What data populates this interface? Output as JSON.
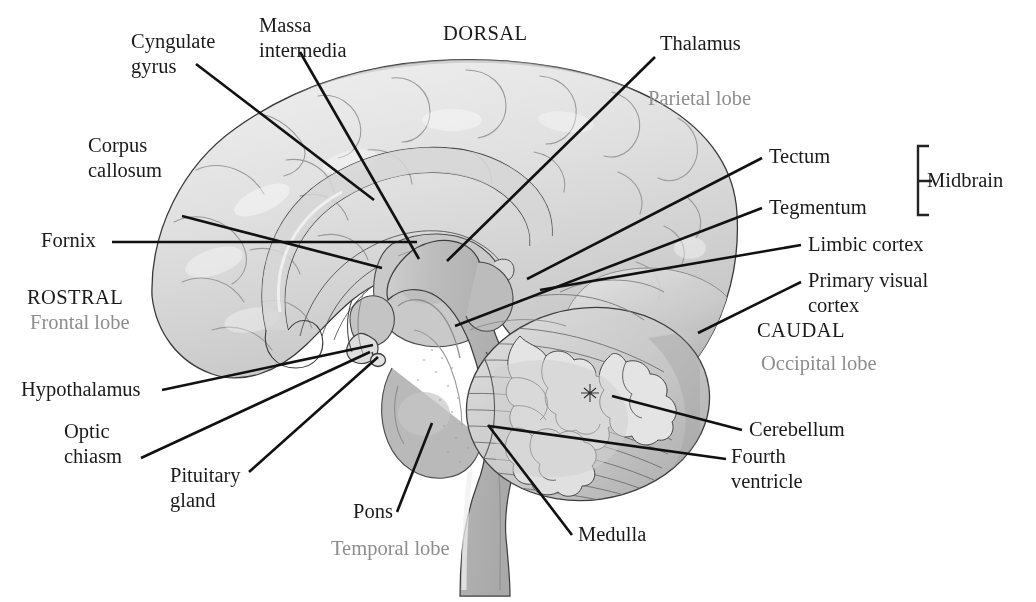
{
  "figure": {
    "title_fragment_top": "",
    "view": "midsagittal-brain-section"
  },
  "colors": {
    "background": "#ffffff",
    "label_text": "#1a1a1a",
    "lobe_text": "#8d8d8d",
    "leader_line": "#111111",
    "cortex_light": "#e6e6e6",
    "cortex_mid": "#d2d2d2",
    "cortex_shadow": "#b0b0b0",
    "brainstem": "#bdbdbd",
    "brainstem_dark": "#a8a8a8",
    "cerebellum": "#cccccc",
    "ventricle": "#f2f2f2",
    "outline": "#3d3d3d"
  },
  "labels": [
    {
      "id": "cyngulate-gyrus",
      "lines": [
        "Cyngulate",
        "gyrus"
      ],
      "x": 131,
      "y": 48,
      "anchor": "start",
      "style": "dark"
    },
    {
      "id": "massa-intermedia",
      "lines": [
        "Massa",
        "intermedia"
      ],
      "x": 259,
      "y": 32,
      "anchor": "start",
      "style": "dark"
    },
    {
      "id": "dorsal",
      "lines": [
        "DORSAL"
      ],
      "x": 443,
      "y": 40,
      "anchor": "start",
      "style": "dir"
    },
    {
      "id": "thalamus",
      "lines": [
        "Thalamus"
      ],
      "x": 660,
      "y": 50,
      "anchor": "start",
      "style": "dark"
    },
    {
      "id": "parietal-lobe",
      "lines": [
        "Parietal lobe"
      ],
      "x": 648,
      "y": 105,
      "anchor": "start",
      "style": "lobe"
    },
    {
      "id": "corpus-callosum",
      "lines": [
        "Corpus",
        "callosum"
      ],
      "x": 88,
      "y": 152,
      "anchor": "start",
      "style": "dark"
    },
    {
      "id": "tectum",
      "lines": [
        "Tectum"
      ],
      "x": 769,
      "y": 163,
      "anchor": "start",
      "style": "dark"
    },
    {
      "id": "midbrain",
      "lines": [
        "Midbrain"
      ],
      "x": 927,
      "y": 187,
      "anchor": "start",
      "style": "dark"
    },
    {
      "id": "tegmentum",
      "lines": [
        "Tegmentum"
      ],
      "x": 769,
      "y": 214,
      "anchor": "start",
      "style": "dark"
    },
    {
      "id": "fornix",
      "lines": [
        "Fornix"
      ],
      "x": 41,
      "y": 247,
      "anchor": "start",
      "style": "dark"
    },
    {
      "id": "limbic-cortex",
      "lines": [
        "Limbic cortex"
      ],
      "x": 808,
      "y": 251,
      "anchor": "start",
      "style": "dark"
    },
    {
      "id": "primary-visual-cortex",
      "lines": [
        "Primary visual",
        "cortex"
      ],
      "x": 808,
      "y": 287,
      "anchor": "start",
      "style": "dark"
    },
    {
      "id": "rostral",
      "lines": [
        "ROSTRAL"
      ],
      "x": 27,
      "y": 304,
      "anchor": "start",
      "style": "dir"
    },
    {
      "id": "frontal-lobe",
      "lines": [
        "Frontal lobe"
      ],
      "x": 30,
      "y": 329,
      "anchor": "start",
      "style": "lobe"
    },
    {
      "id": "caudal",
      "lines": [
        "CAUDAL"
      ],
      "x": 757,
      "y": 337,
      "anchor": "start",
      "style": "dir"
    },
    {
      "id": "occipital-lobe",
      "lines": [
        "Occipital lobe"
      ],
      "x": 761,
      "y": 370,
      "anchor": "start",
      "style": "lobe"
    },
    {
      "id": "hypothalamus",
      "lines": [
        "Hypothalamus"
      ],
      "x": 21,
      "y": 396,
      "anchor": "start",
      "style": "dark"
    },
    {
      "id": "optic-chiasm",
      "lines": [
        "Optic",
        "chiasm"
      ],
      "x": 64,
      "y": 438,
      "anchor": "start",
      "style": "dark"
    },
    {
      "id": "cerebellum",
      "lines": [
        "Cerebellum"
      ],
      "x": 749,
      "y": 436,
      "anchor": "start",
      "style": "dark"
    },
    {
      "id": "fourth-ventricle",
      "lines": [
        "Fourth",
        "ventricle"
      ],
      "x": 731,
      "y": 463,
      "anchor": "start",
      "style": "dark"
    },
    {
      "id": "pituitary-gland",
      "lines": [
        "Pituitary",
        "gland"
      ],
      "x": 170,
      "y": 482,
      "anchor": "start",
      "style": "dark"
    },
    {
      "id": "pons",
      "lines": [
        "Pons"
      ],
      "x": 353,
      "y": 518,
      "anchor": "start",
      "style": "dark"
    },
    {
      "id": "medulla",
      "lines": [
        "Medulla"
      ],
      "x": 578,
      "y": 541,
      "anchor": "start",
      "style": "dark"
    },
    {
      "id": "temporal-lobe",
      "lines": [
        "Temporal lobe"
      ],
      "x": 331,
      "y": 555,
      "anchor": "start",
      "style": "lobe"
    }
  ],
  "leaders": [
    {
      "id": "leader-cyngulate-gyrus",
      "points": "196,64 374,200"
    },
    {
      "id": "leader-corpus-callosum",
      "points": "182,216 382,268"
    },
    {
      "id": "leader-fornix",
      "points": "112,242 417,242"
    },
    {
      "id": "leader-massa-intermedia",
      "points": "300,52 419,259"
    },
    {
      "id": "leader-thalamus",
      "points": "655,57 447,261"
    },
    {
      "id": "leader-tectum",
      "points": "762,158 527,279"
    },
    {
      "id": "leader-tegmentum",
      "points": "762,208 455,326"
    },
    {
      "id": "leader-limbic-cortex",
      "points": "801,245 540,290"
    },
    {
      "id": "leader-primary-visual-cortex",
      "points": "801,282 698,333"
    },
    {
      "id": "leader-hypothalamus",
      "points": "162,390 373,345"
    },
    {
      "id": "leader-optic-chiasm",
      "points": "141,458 370,352"
    },
    {
      "id": "leader-pituitary-gland",
      "points": "249,472 378,357"
    },
    {
      "id": "leader-pons",
      "points": "397,512 432,423"
    },
    {
      "id": "leader-medulla",
      "points": "572,535 488,425"
    },
    {
      "id": "leader-cerebellum",
      "points": "742,430 612,396"
    },
    {
      "id": "leader-fourth-ventricle",
      "points": "726,459 489,426"
    }
  ],
  "bracket": {
    "id": "midbrain-bracket",
    "x": 918,
    "y_top": 146,
    "y_bottom": 215,
    "arm": 11,
    "stub_y": 181,
    "stub_len": 14
  }
}
